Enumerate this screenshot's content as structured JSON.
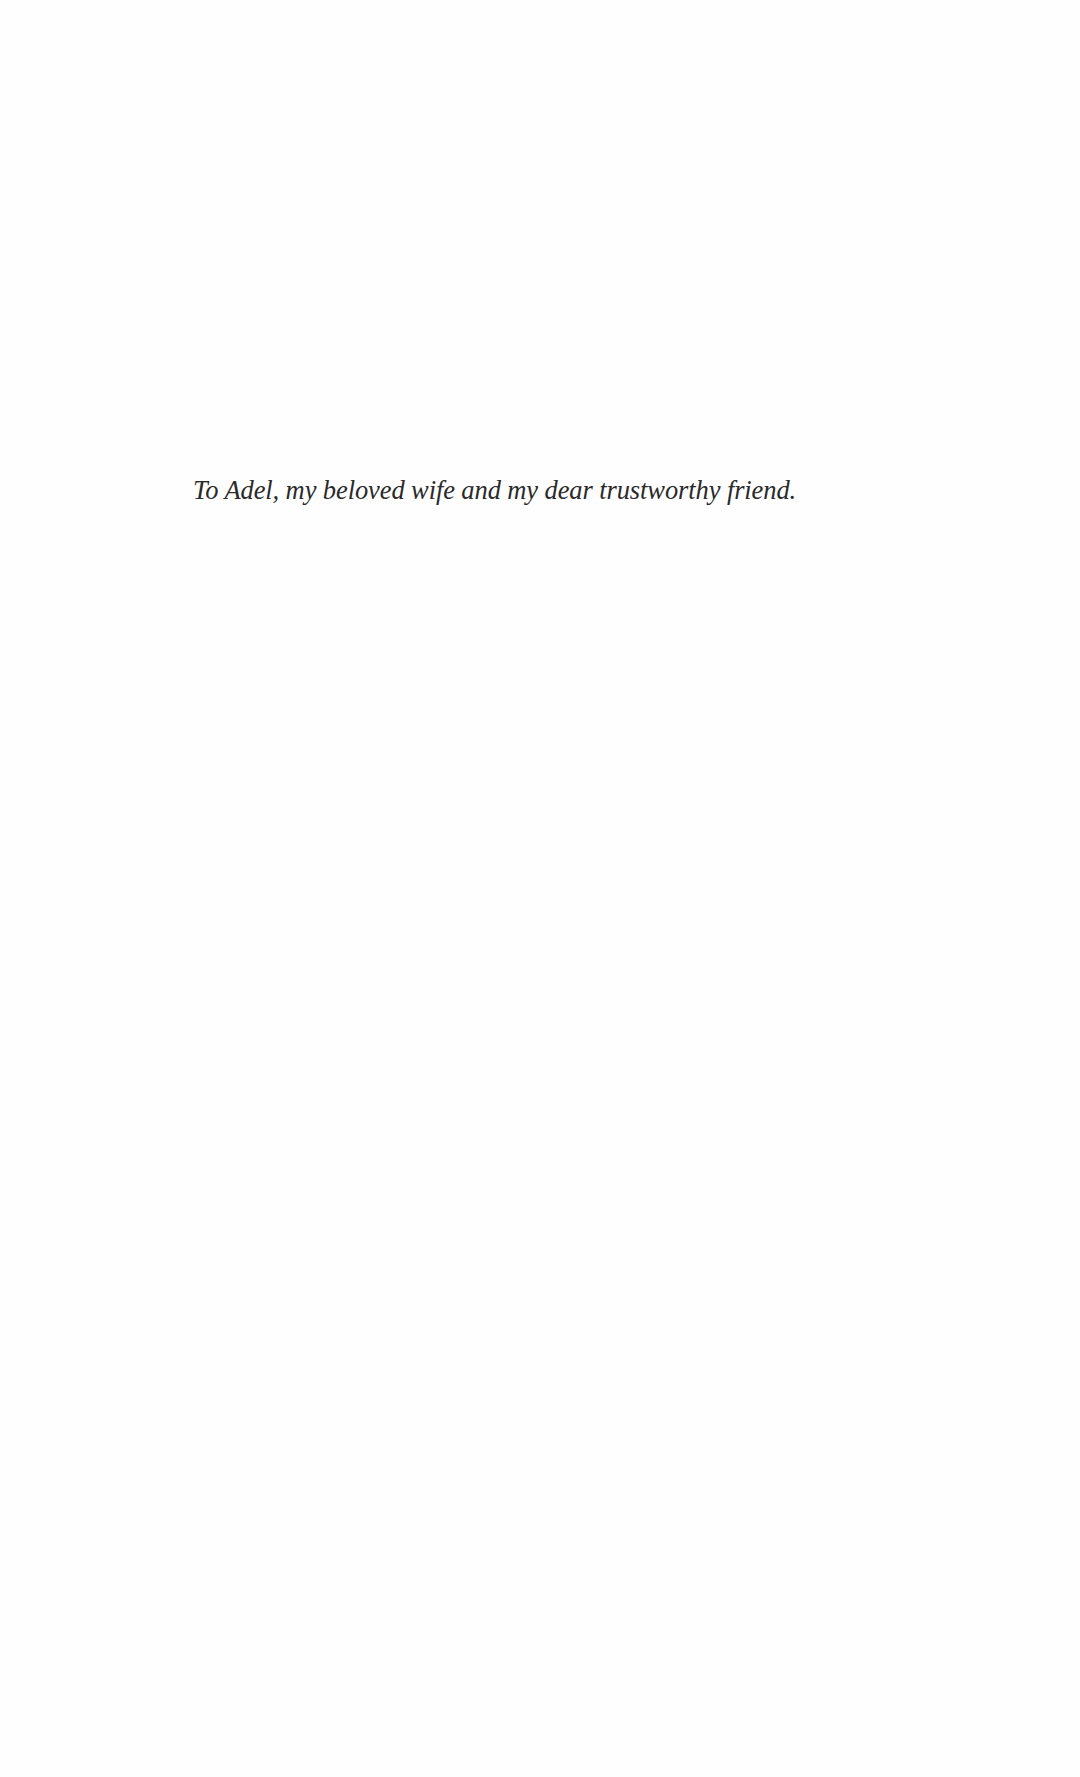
{
  "page": {
    "type": "dedication",
    "dedication_text": "To Adel, my beloved wife and my dear trustworthy friend."
  }
}
